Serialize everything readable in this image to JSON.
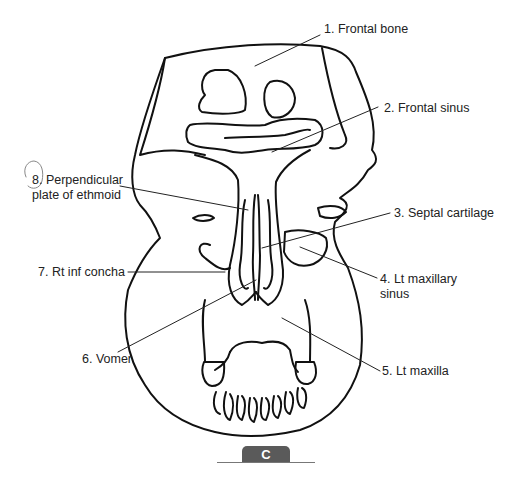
{
  "figure": {
    "panel_letter": "C",
    "colors": {
      "line": "#111111",
      "leader": "#222222",
      "badge_bg": "#5a5a5a",
      "badge_text": "#ffffff"
    }
  },
  "labels": [
    {
      "num": "1.",
      "text": "Frontal bone",
      "full": "1. Frontal bone"
    },
    {
      "num": "2.",
      "text": "Frontal sinus",
      "full": "2. Frontal sinus"
    },
    {
      "num": "3.",
      "text": "Septal cartilage",
      "full": "3. Septal cartilage"
    },
    {
      "num": "4.",
      "text": "Lt maxillary sinus",
      "line1": "4. Lt maxillary",
      "line2": "sinus"
    },
    {
      "num": "5.",
      "text": "Lt maxilla",
      "full": "5. Lt maxilla"
    },
    {
      "num": "6.",
      "text": "Vomer",
      "full": "6. Vomer"
    },
    {
      "num": "7.",
      "text": "Rt inf concha",
      "full": "7. Rt inf concha"
    },
    {
      "num": "8.",
      "text": "Perpendicular plate of ethmoid",
      "line1": "8. Perpendicular",
      "line2": "plate of ethmoid",
      "circled": true
    }
  ]
}
